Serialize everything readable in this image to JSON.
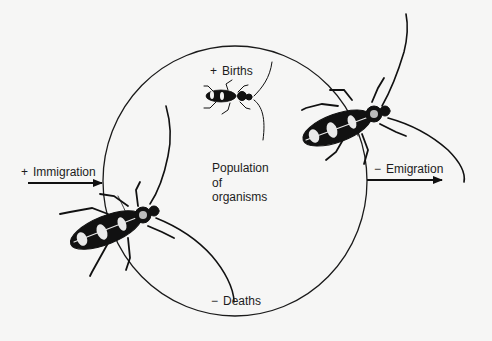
{
  "diagram": {
    "center_label": [
      "Population",
      "of",
      "organisms"
    ],
    "flows": [
      {
        "id": "births",
        "sign": "+",
        "label": "Births"
      },
      {
        "id": "immigration",
        "sign": "+",
        "label": "Immigration"
      },
      {
        "id": "emigration",
        "sign": "−",
        "label": "Emigration"
      },
      {
        "id": "deaths",
        "sign": "−",
        "label": "Deaths"
      }
    ],
    "illustrations": [
      "small-beetle",
      "large-beetle-left",
      "large-beetle-right"
    ],
    "colors": {
      "background": "#f6f6f5",
      "ink": "#1a1a1a"
    }
  }
}
